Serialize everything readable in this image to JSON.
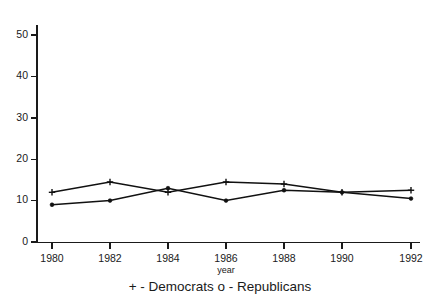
{
  "chart_data": {
    "type": "line",
    "title": "",
    "subtitle": "",
    "xlabel": "year",
    "ylabel": "",
    "x": [
      1980,
      1982,
      1984,
      1986,
      1988,
      1990,
      1992
    ],
    "categories": [
      "1980",
      "1982",
      "1984",
      "1986",
      "1988",
      "1990",
      "1992"
    ],
    "series": [
      {
        "name": "Democrats",
        "marker": "+",
        "legend_text": "+ - Democrats",
        "values": [
          12,
          14.5,
          12,
          14.5,
          14,
          12,
          12.5
        ]
      },
      {
        "name": "Republicans",
        "marker": "o",
        "legend_text": "o - Republicans",
        "values": [
          9,
          10,
          13,
          10,
          12.5,
          12,
          10.5
        ]
      }
    ],
    "xlim": [
      1979.2,
      1993.2
    ],
    "ylim": [
      0,
      52
    ],
    "ytick_labels": [
      "0",
      "10",
      "20",
      "30",
      "40",
      "50"
    ],
    "yticks": [
      0,
      10,
      20,
      30,
      40,
      50
    ],
    "xtick_labels": [
      "1980",
      "1982",
      "1984",
      "1986",
      "1988",
      "1990",
      "1992"
    ],
    "grid": false,
    "legend_position": "below-axis",
    "legend_caption": "+ - Democrats o - Republicans",
    "colors": {
      "line": "#111111",
      "axis": "#1a1a1a",
      "background": "#ffffff"
    }
  },
  "labels": {
    "y_0": "0",
    "y_10": "10",
    "y_20": "20",
    "y_30": "30",
    "y_40": "40",
    "y_50": "50",
    "x_1980": "1980",
    "x_1982": "1982",
    "x_1984": "1984",
    "x_1986": "1986",
    "x_1988": "1988",
    "x_1990": "1990",
    "x_1992": "1992",
    "x_axis_title": "year",
    "legend_caption": "+ - Democrats o - Republicans"
  }
}
